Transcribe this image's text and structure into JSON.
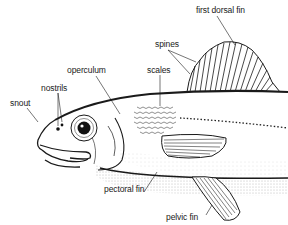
{
  "diagram": {
    "type": "anatomical-illustration",
    "labels": [
      {
        "id": "first-dorsal-fin",
        "text": "first dorsal fin",
        "x": 196,
        "y": 6
      },
      {
        "id": "spines",
        "text": "spines",
        "x": 155,
        "y": 40
      },
      {
        "id": "scales",
        "text": "scales",
        "x": 147,
        "y": 66
      },
      {
        "id": "operculum",
        "text": "operculum",
        "x": 67,
        "y": 66
      },
      {
        "id": "nostrils",
        "text": "nostrils",
        "x": 41,
        "y": 84
      },
      {
        "id": "snout",
        "text": "snout",
        "x": 10,
        "y": 99
      },
      {
        "id": "pectoral-fin",
        "text": "pectoral fin",
        "x": 104,
        "y": 185
      },
      {
        "id": "pelvic-fin",
        "text": "pelvic fin",
        "x": 166,
        "y": 213
      }
    ],
    "colors": {
      "ink": "#1a1a1a",
      "background": "#ffffff",
      "stipple": "#6a6a6a"
    }
  }
}
